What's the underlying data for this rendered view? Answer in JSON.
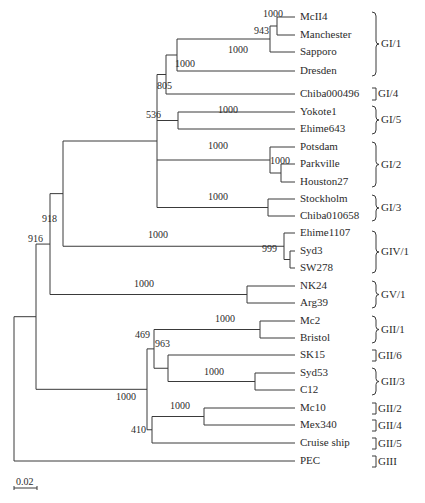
{
  "diagram": {
    "type": "phylogenetic-tree",
    "leaves": [
      {
        "name": "McII4",
        "y": 17
      },
      {
        "name": "Manchester",
        "y": 35
      },
      {
        "name": "Sapporo",
        "y": 52
      },
      {
        "name": "Dresden",
        "y": 71
      },
      {
        "name": "Chiba000496",
        "y": 94
      },
      {
        "name": "Yokote1",
        "y": 112
      },
      {
        "name": "Ehime643",
        "y": 129
      },
      {
        "name": "Potsdam",
        "y": 147
      },
      {
        "name": "Parkville",
        "y": 164
      },
      {
        "name": "Houston27",
        "y": 182
      },
      {
        "name": "Stockholm",
        "y": 199
      },
      {
        "name": "Chiba010658",
        "y": 216
      },
      {
        "name": "Ehime1107",
        "y": 233
      },
      {
        "name": "Syd3",
        "y": 251
      },
      {
        "name": "SW278",
        "y": 268
      },
      {
        "name": "NK24",
        "y": 286
      },
      {
        "name": "Arg39",
        "y": 303
      },
      {
        "name": "Mc2",
        "y": 321
      },
      {
        "name": "Bristol",
        "y": 338
      },
      {
        "name": "SK15",
        "y": 355
      },
      {
        "name": "Syd53",
        "y": 373
      },
      {
        "name": "C12",
        "y": 390
      },
      {
        "name": "Mc10",
        "y": 408
      },
      {
        "name": "Mex340",
        "y": 425
      },
      {
        "name": "Cruise ship",
        "y": 443
      },
      {
        "name": "PEC",
        "y": 461
      }
    ],
    "bootstrap_values": [
      {
        "value": "1000",
        "x": 263,
        "y": 19
      },
      {
        "value": "943",
        "x": 254,
        "y": 36
      },
      {
        "value": "1000",
        "x": 228,
        "y": 55
      },
      {
        "value": "1000",
        "x": 175,
        "y": 69
      },
      {
        "value": "805",
        "x": 157,
        "y": 91
      },
      {
        "value": "1000",
        "x": 218,
        "y": 115
      },
      {
        "value": "536",
        "x": 146,
        "y": 120
      },
      {
        "value": "1000",
        "x": 208,
        "y": 151
      },
      {
        "value": "1000",
        "x": 270,
        "y": 166
      },
      {
        "value": "1000",
        "x": 208,
        "y": 202
      },
      {
        "value": "918",
        "x": 42,
        "y": 224
      },
      {
        "value": "1000",
        "x": 148,
        "y": 240
      },
      {
        "value": "999",
        "x": 262,
        "y": 254
      },
      {
        "value": "916",
        "x": 28,
        "y": 244
      },
      {
        "value": "1000",
        "x": 134,
        "y": 289
      },
      {
        "value": "1000",
        "x": 116,
        "y": 402
      },
      {
        "value": "1000",
        "x": 215,
        "y": 324
      },
      {
        "value": "469",
        "x": 135,
        "y": 340
      },
      {
        "value": "963",
        "x": 155,
        "y": 349
      },
      {
        "value": "1000",
        "x": 204,
        "y": 377
      },
      {
        "value": "1000",
        "x": 170,
        "y": 411
      },
      {
        "value": "410",
        "x": 131,
        "y": 435
      }
    ],
    "genogroups": [
      {
        "label": "GI/1",
        "y_top": 12,
        "y_bot": 76
      },
      {
        "label": "GI/4",
        "y_top": 88,
        "y_bot": 100
      },
      {
        "label": "GI/5",
        "y_top": 106,
        "y_bot": 134
      },
      {
        "label": "GI/2",
        "y_top": 142,
        "y_bot": 187
      },
      {
        "label": "GI/3",
        "y_top": 195,
        "y_bot": 221
      },
      {
        "label": "GIV/1",
        "y_top": 231,
        "y_bot": 273
      },
      {
        "label": "GV/1",
        "y_top": 281,
        "y_bot": 308
      },
      {
        "label": "GII/1",
        "y_top": 316,
        "y_bot": 343
      },
      {
        "label": "GII/6",
        "y_top": 350,
        "y_bot": 361
      },
      {
        "label": "GII/3",
        "y_top": 368,
        "y_bot": 395
      },
      {
        "label": "GII/2",
        "y_top": 403,
        "y_bot": 414
      },
      {
        "label": "GII/4",
        "y_top": 420,
        "y_bot": 431
      },
      {
        "label": "GII/5",
        "y_top": 438,
        "y_bot": 449
      },
      {
        "label": "GIII",
        "y_top": 456,
        "y_bot": 467
      }
    ],
    "scale_bar": {
      "label": "0.02",
      "x1": 14,
      "x2": 37,
      "y": 488
    }
  }
}
